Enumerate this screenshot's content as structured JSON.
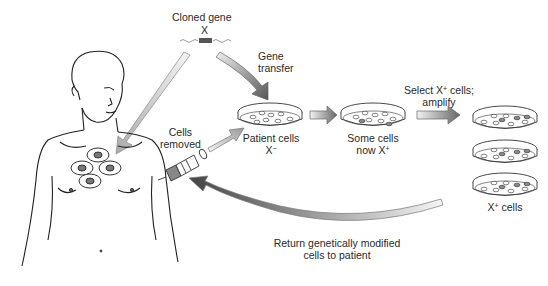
{
  "diagram": {
    "labels": {
      "cloned_gene": "Cloned gene",
      "gene_symbol": "X",
      "gene_transfer_1": "Gene",
      "gene_transfer_2": "transfer",
      "cells_removed_1": "Cells",
      "cells_removed_2": "removed",
      "patient_cells": "Patient cells",
      "patient_cells_genotype": "X",
      "patient_cells_sup": "−",
      "some_cells_1": "Some cells",
      "some_cells_2": "now X",
      "some_cells_sup": "+",
      "select_1a": "Select X",
      "select_1_sup": "+",
      "select_1b": " cells;",
      "select_2": "amplify",
      "xplus_cells_a": "X",
      "xplus_cells_sup": "+",
      "xplus_cells_b": " cells",
      "return_1": "Return genetically modified",
      "return_2": "cells to patient"
    },
    "colors": {
      "line": "#333333",
      "arrow_dark": "#555555",
      "arrow_light": "#eeeeee",
      "gene_box": "#555555",
      "treated_cell": "#888888"
    }
  }
}
